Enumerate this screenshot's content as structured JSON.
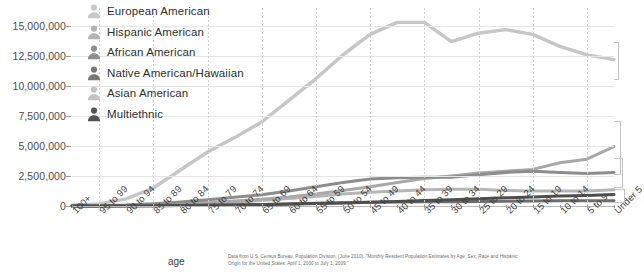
{
  "chart_data": {
    "type": "line",
    "title": "",
    "xlabel": "age",
    "ylabel": "",
    "ylim": [
      0,
      16500000
    ],
    "yticks": [
      0,
      2500000,
      5000000,
      7500000,
      10000000,
      12500000,
      15000000
    ],
    "ytick_labels": [
      "0",
      "2,500,000",
      "5,000,000",
      "7,500,000",
      "10,000,000",
      "12,500,000",
      "15,000,000"
    ],
    "grid": "horizontal-solid-vertical-dotted",
    "legend_position": "top-left-inside",
    "categories": [
      "100+",
      "95 to 99",
      "90 to 94",
      "85 to 89",
      "80 to 84",
      "75 to 79",
      "70 to 74",
      "65 to 69",
      "60 to 64",
      "55 to 59",
      "50 to 54",
      "45 to 49",
      "40 to 44",
      "35 to 39",
      "30 to 34",
      "25 to 29",
      "20 to 24",
      "15 to 19",
      "10 to 14",
      "5 to 9",
      "Under 5"
    ],
    "series": [
      {
        "name": "European American",
        "color": "#c6c6c6",
        "values": [
          60000,
          180000,
          600000,
          1500000,
          3000000,
          4500000,
          5700000,
          7000000,
          8800000,
          10600000,
          12600000,
          14300000,
          15300000,
          15300000,
          13700000,
          14400000,
          14700000,
          14300000,
          13300000,
          12600000,
          12200000
        ]
      },
      {
        "name": "Hispanic American",
        "color": "#a8a8a8",
        "values": [
          8000,
          20000,
          50000,
          110000,
          200000,
          300000,
          420000,
          560000,
          760000,
          1000000,
          1300000,
          1600000,
          1950000,
          2300000,
          2500000,
          2750000,
          2900000,
          3050000,
          3600000,
          3900000,
          4950000
        ]
      },
      {
        "name": "African American",
        "color": "#8d8d8d",
        "values": [
          12000,
          30000,
          80000,
          180000,
          330000,
          520000,
          720000,
          940000,
          1250000,
          1600000,
          1950000,
          2250000,
          2350000,
          2400000,
          2400000,
          2600000,
          2800000,
          2900000,
          2800000,
          2700000,
          2800000
        ]
      },
      {
        "name": "Native American/Hawaiian",
        "color": "#6e6e6e",
        "values": [
          2000,
          4000,
          11000,
          24000,
          45000,
          70000,
          100000,
          135000,
          180000,
          230000,
          280000,
          320000,
          340000,
          350000,
          360000,
          380000,
          400000,
          420000,
          430000,
          430000,
          440000
        ]
      },
      {
        "name": "Asian American",
        "color": "#b5b5b5",
        "values": [
          4000,
          10000,
          28000,
          65000,
          130000,
          220000,
          330000,
          450000,
          620000,
          800000,
          1000000,
          1150000,
          1250000,
          1350000,
          1400000,
          1400000,
          1300000,
          1250000,
          1250000,
          1250000,
          1350000
        ]
      },
      {
        "name": "Multiethnic",
        "color": "#4f4f4f",
        "values": [
          1000,
          3000,
          8000,
          18000,
          35000,
          55000,
          80000,
          110000,
          150000,
          200000,
          260000,
          320000,
          380000,
          450000,
          520000,
          600000,
          680000,
          760000,
          830000,
          880000,
          950000
        ]
      }
    ]
  },
  "legend": {
    "items": [
      {
        "label": "European American",
        "icon": "person-icon",
        "color": "#c9c9c9"
      },
      {
        "label": "Hispanic American",
        "icon": "person-icon",
        "color": "#b3b3b3"
      },
      {
        "label": "African American",
        "icon": "person-icon",
        "color": "#8f8f8f"
      },
      {
        "label": "Native American/Hawaiian",
        "icon": "person-icon",
        "color": "#777777"
      },
      {
        "label": "Asian American",
        "icon": "person-icon",
        "color": "#c2c2c2"
      },
      {
        "label": "Multiethnic",
        "icon": "person-icon",
        "color": "#545454"
      }
    ]
  },
  "source_note": "Data from U.S. Census Bureau, Population Division. (June 2010). \"Monthly Resident Population Estimates by Age, Sex, Race and Hispanic Origin for the United States: April 1, 2000 to July 1, 2009.\""
}
